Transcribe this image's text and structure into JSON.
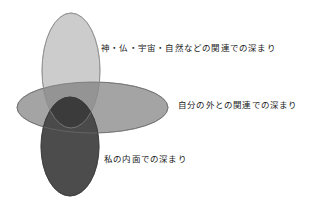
{
  "diagram": {
    "title": "",
    "type": "venn-three-ellipse",
    "background_color": "#ffffff",
    "ellipses": [
      {
        "id": "spiritual",
        "name": "vertical-top-ellipse",
        "orientation": "vertical",
        "cx": 71,
        "cy": 70.5,
        "rx": 29,
        "ry": 57.5,
        "fill": "#c8c8c8",
        "stroke": "#8a8a8a",
        "label_ref": "outer_relation"
      },
      {
        "id": "external",
        "name": "horizontal-middle-ellipse",
        "orientation": "horizontal",
        "cx": 92.5,
        "cy": 107.5,
        "rx": 75.5,
        "ry": 25.5,
        "fill": "#a0a0a0",
        "stroke": "#7a7a7a",
        "label_ref": "self_external"
      },
      {
        "id": "inner",
        "name": "vertical-bottom-ellipse",
        "orientation": "vertical",
        "cx": 70,
        "cy": 146.5,
        "rx": 29,
        "ry": 49.5,
        "fill": "#4a4a4a",
        "stroke": "#3a3a3a",
        "label_ref": "inner_self"
      }
    ],
    "labels": {
      "outer_relation": "神・仏・宇宙・自然などの関連での深まり",
      "self_external": "自分の外との関連での深まり",
      "inner_self": "私の内面での深まり"
    },
    "overlap_colors": {
      "spiritual_external": "#8f8f8f",
      "external_inner": "#4a4a4a",
      "triple_core": "#3a3a3a"
    }
  }
}
